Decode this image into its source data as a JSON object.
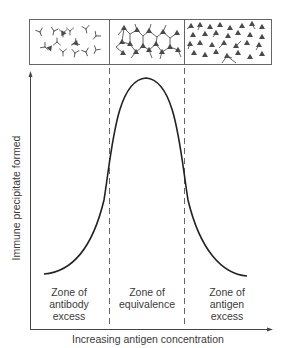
{
  "figure": {
    "type": "diagram",
    "y_axis_label": "Immune precipitate formed",
    "x_axis_label": "Increasing antigen concentration",
    "zones": [
      {
        "line1": "Zone of",
        "line2": "antibody",
        "line3": "excess"
      },
      {
        "line1": "Zone of",
        "line2": "equivalence",
        "line3": ""
      },
      {
        "line1": "Zone of",
        "line2": "antigen",
        "line3": "excess"
      }
    ],
    "panels": [
      {
        "name": "antibody-excess-panel",
        "content": "free Y-shaped antibodies with few antigen triangles"
      },
      {
        "name": "equivalence-panel",
        "content": "cross-linked lattice of antibodies and antigens"
      },
      {
        "name": "antigen-excess-panel",
        "content": "many free antigen triangles with few bound antibodies"
      }
    ],
    "colors": {
      "line": "#2a2a2a",
      "box": "#555555",
      "antigen": "#4a4a4a",
      "antibody": "#555555",
      "text": "#3a3a3a"
    }
  }
}
